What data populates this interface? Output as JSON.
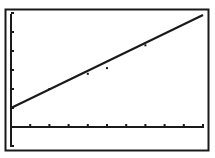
{
  "chart_data": {
    "type": "scatter",
    "title": "",
    "xlabel": "",
    "ylabel": "",
    "xlim": [
      0,
      10
    ],
    "ylim": [
      -1,
      6
    ],
    "x_tick_step": 1,
    "y_tick_step": 1,
    "grid": false,
    "legend": null,
    "series": [
      {
        "name": "regression line",
        "kind": "line",
        "equation": "y = 0.5x + 1",
        "x": [
          0,
          10
        ],
        "y": [
          1.0,
          5.9
        ]
      },
      {
        "name": "data points",
        "kind": "scatter",
        "x": [
          2,
          4,
          5,
          7
        ],
        "y": [
          2.0,
          2.8,
          3.1,
          4.3
        ]
      }
    ]
  },
  "display": {
    "colors": {
      "background": "#ffffff",
      "ink": "#1a1a1a"
    }
  }
}
